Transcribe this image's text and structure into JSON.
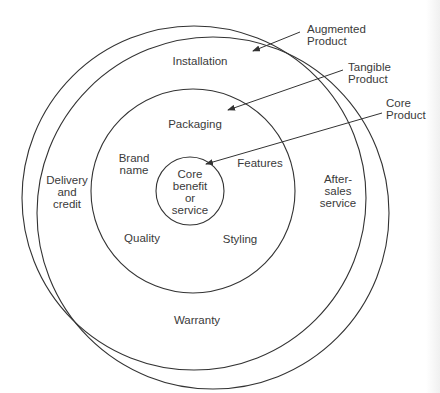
{
  "diagram": {
    "callouts": [
      {
        "id": "augmented",
        "text": "Augmented\nProduct"
      },
      {
        "id": "tangible",
        "text": "Tangible\nProduct"
      },
      {
        "id": "core",
        "text": "Core\nProduct"
      }
    ],
    "outer_ring": {
      "top": "Installation",
      "left": "Delivery\nand\ncredit",
      "right": "After-\nsales\nservice",
      "bottom": "Warranty"
    },
    "middle_ring": {
      "top": "Packaging",
      "upper_left": "Brand\nname",
      "upper_right": "Features",
      "lower_left": "Quality",
      "lower_right": "Styling"
    },
    "core_circle": {
      "text": "Core\nbenefit\nor\nservice"
    },
    "colors": {
      "line": "#333333",
      "text": "#3a3a3a",
      "background": "#ffffff"
    }
  }
}
